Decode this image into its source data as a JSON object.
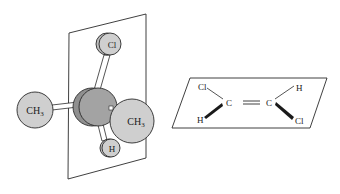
{
  "figure": {
    "left_model": {
      "description": "3D ball-and-stick model of a stereocenter on a mirror plane",
      "atoms": {
        "top": "Cl",
        "left": "CH3",
        "right": "CH3",
        "bottom": "H"
      }
    },
    "right_model": {
      "description": "Planar structural formula of trans-1,2-dichloroethene within a plane",
      "atoms": {
        "c1": "C",
        "c2": "C",
        "c1_upper": "Cl",
        "c1_lower": "H",
        "c2_upper": "H",
        "c2_lower": "Cl"
      },
      "bond": "="
    }
  },
  "colors": {
    "sphere_light": "#cfcfcf",
    "sphere_dark": "#9a9a9a",
    "line": "#2a2a2a"
  }
}
